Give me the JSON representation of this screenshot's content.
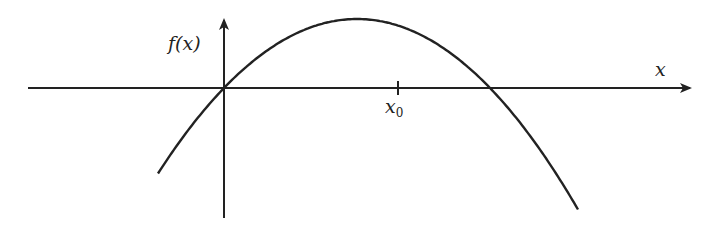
{
  "diagram": {
    "y_axis_label": "f(x)",
    "x_axis_label": "x",
    "tick_label_main": "x",
    "tick_label_sub": "0",
    "stroke_color": "#222222",
    "background": "#ffffff"
  },
  "chart_data": {
    "type": "line",
    "title": "",
    "xlabel": "x",
    "ylabel": "f(x)",
    "annotations": [
      "x0 tick on x-axis"
    ],
    "pixel_geometry": {
      "origin": [
        224,
        88
      ],
      "x_axis": {
        "from": 28,
        "to": 690,
        "y": 88
      },
      "y_axis": {
        "x": 224,
        "from": 218,
        "to": 20
      },
      "tick_x0": 398,
      "curve": {
        "roots_px": [
          224,
          490
        ],
        "apex_px": [
          358,
          19
        ],
        "x_start": 158,
        "x_end": 578
      }
    }
  }
}
